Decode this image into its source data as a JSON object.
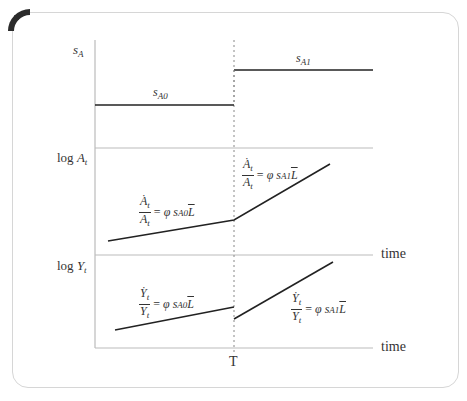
{
  "diagram": {
    "panels": [
      {
        "id": "saving-rate",
        "y_label": {
          "base": "s",
          "sub": "A"
        },
        "segments": [
          {
            "label": {
              "base": "s",
              "sub": "A0"
            }
          },
          {
            "label": {
              "base": "s",
              "sub": "A1"
            }
          }
        ]
      },
      {
        "id": "log-technology",
        "y_label": {
          "prefix": "log ",
          "base": "A",
          "sub": "t"
        },
        "x_label": "time",
        "equations": [
          {
            "num": "A",
            "num_sub": "t",
            "den": "A",
            "den_sub": "t",
            "rhs_eq": "= ",
            "phi": "φ",
            "s": "s",
            "s_sub": "A0",
            "L": "L"
          },
          {
            "num": "A",
            "num_sub": "t",
            "den": "A",
            "den_sub": "t",
            "rhs_eq": "= ",
            "phi": "φ",
            "s": "s",
            "s_sub": "A1",
            "L": "L"
          }
        ]
      },
      {
        "id": "log-output",
        "y_label": {
          "prefix": "log ",
          "base": "Y",
          "sub": "t"
        },
        "x_label": "time",
        "equations": [
          {
            "num": "Y",
            "num_sub": "t",
            "den": "Y",
            "den_sub": "t",
            "rhs_eq": "= ",
            "phi": "φ",
            "s": "s",
            "s_sub": "A0",
            "L": "L"
          },
          {
            "num": "Y",
            "num_sub": "t",
            "den": "Y",
            "den_sub": "t",
            "rhs_eq": "= ",
            "phi": "φ",
            "s": "s",
            "s_sub": "A1",
            "L": "L"
          }
        ]
      }
    ],
    "shock_time_label": "T",
    "dot_glyph": "·",
    "colors": {
      "line": "#222222",
      "axis": "#bbbbbb",
      "dashed": "#888888",
      "frame": "#d6d6d6",
      "corner": "#2b2b2b"
    }
  }
}
